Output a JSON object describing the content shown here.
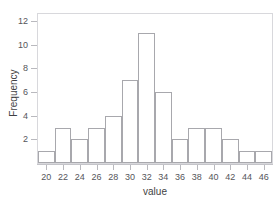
{
  "figure": {
    "background_color": "#ffffff",
    "frame_color": "#d8d8dc",
    "clipped_title_text": "·          ·      ·"
  },
  "chart_data": {
    "type": "bar",
    "title": "",
    "xlabel": "value",
    "ylabel": "Frequency",
    "xlim": [
      19,
      47
    ],
    "ylim": [
      0,
      12.6
    ],
    "grid": false,
    "legend": null,
    "bin_width": 2,
    "bin_edges": [
      19,
      21,
      23,
      25,
      27,
      29,
      31,
      33,
      35,
      37,
      39,
      41,
      43,
      45,
      47
    ],
    "categories": [
      "19-21",
      "21-23",
      "23-25",
      "25-27",
      "27-29",
      "29-31",
      "31-33",
      "33-35",
      "35-37",
      "37-39",
      "39-41",
      "41-43",
      "43-45",
      "45-47"
    ],
    "values": [
      1,
      3,
      2,
      3,
      4,
      7,
      11,
      6,
      2,
      3,
      3,
      2,
      1,
      1
    ],
    "bar_fill_color": "#ffffff",
    "bar_edge_color": "#a8a8ad",
    "xticks": [
      20,
      22,
      24,
      26,
      28,
      30,
      32,
      34,
      36,
      38,
      40,
      42,
      44,
      46
    ],
    "xtick_labels": [
      "20",
      "22",
      "24",
      "26",
      "28",
      "30",
      "32",
      "34",
      "36",
      "38",
      "40",
      "42",
      "44",
      "46"
    ],
    "yticks": [
      2,
      4,
      6,
      8,
      10,
      12
    ],
    "ytick_labels": [
      "2",
      "4",
      "6",
      "8",
      "10",
      "12"
    ]
  }
}
